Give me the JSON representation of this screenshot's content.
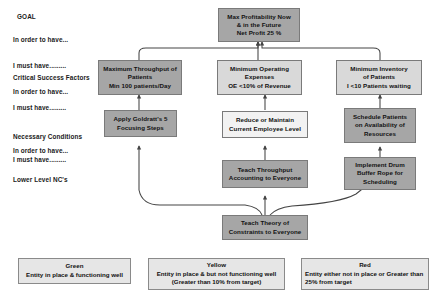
{
  "diagram": {
    "title_label": "GOAL",
    "left_labels": [
      {
        "id": "goal",
        "text": "GOAL"
      },
      {
        "id": "in-order-to-have-1",
        "text": "In order to have..."
      },
      {
        "id": "i-must-have-1",
        "text": "I must have........."
      },
      {
        "id": "critical-success-factors",
        "text": "Critical Success Factors"
      },
      {
        "id": "in-order-to-have-2",
        "text": "In order to have..."
      },
      {
        "id": "i-must-have-2",
        "text": "I must have........."
      },
      {
        "id": "necessary-conditions",
        "text": "Necessary Conditions"
      },
      {
        "id": "in-order-to-have-3",
        "text": "In order to have..."
      },
      {
        "id": "i-must-have-3",
        "text": "I must have........."
      },
      {
        "id": "lower-level-ncs",
        "text": "Lower Level NC's"
      }
    ],
    "nodes": [
      {
        "id": "goal-node",
        "name": "max-profitability-node",
        "lines": [
          "Max Profitability Now",
          "& in the Future",
          "Net Profit 25 %"
        ],
        "color": "#a6a6a6",
        "status": "red"
      },
      {
        "id": "csf-throughput",
        "name": "maximum-throughput-node",
        "lines": [
          "Maximum Throughput of",
          "Patients",
          "Min 100 patients/Day"
        ],
        "color": "#a6a6a6",
        "status": "red"
      },
      {
        "id": "csf-expenses",
        "name": "minimum-operating-expenses-node",
        "lines": [
          "Minimum Operating",
          "Expenses",
          "OE <10% of Revenue"
        ],
        "color": "#d9d9d9",
        "status": "yellow"
      },
      {
        "id": "csf-inventory",
        "name": "minimum-inventory-node",
        "lines": [
          "Minimum Inventory",
          "of Patients",
          "I <10 Patients waiting"
        ],
        "color": "#d9d9d9",
        "status": "yellow"
      },
      {
        "id": "nc-goldratt",
        "name": "apply-goldratt-five-focusing-steps-node",
        "lines": [
          "Apply Goldratt's 5",
          "Focusing Steps"
        ],
        "color": "#a6a6a6",
        "status": "red"
      },
      {
        "id": "nc-employee",
        "name": "reduce-or-maintain-employee-level-node",
        "lines": [
          "Reduce or Maintain",
          "Current Employee Level"
        ],
        "color": "#f2f2f2",
        "status": "green"
      },
      {
        "id": "nc-schedule",
        "name": "schedule-patients-on-availability-node",
        "lines": [
          "Schedule Patients",
          "on Availability of",
          "Resources"
        ],
        "color": "#a6a6a6",
        "status": "red"
      },
      {
        "id": "ll-throughput-accounting",
        "name": "teach-throughput-accounting-node",
        "lines": [
          "Teach Throughput",
          "Accounting to Everyone"
        ],
        "color": "#a6a6a6",
        "status": "red"
      },
      {
        "id": "ll-drum-buffer-rope",
        "name": "implement-drum-buffer-rope-node",
        "lines": [
          "Implement Drum",
          "Buffer Rope for",
          "Scheduling"
        ],
        "color": "#a6a6a6",
        "status": "red"
      },
      {
        "id": "ll-teach-toc",
        "name": "teach-theory-of-constraints-node",
        "lines": [
          "Teach Theory of",
          "Constraints to Everyone"
        ],
        "color": "#a6a6a6",
        "status": "red"
      }
    ],
    "legend": [
      {
        "id": "legend-green",
        "title": "Green",
        "desc": "Entity in place & functioning well",
        "color": "#e6e6e6"
      },
      {
        "id": "legend-yellow",
        "title": "Yellow",
        "desc": "Entity in place & but not functioning well (Greater than 10% from target)",
        "color": "#e6e6e6"
      },
      {
        "id": "legend-red",
        "title": "Red",
        "desc": "Entity either not in place or Greater than 25% from target",
        "color": "#e6e6e6"
      }
    ]
  }
}
